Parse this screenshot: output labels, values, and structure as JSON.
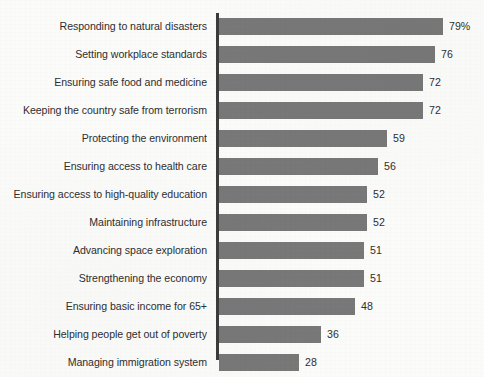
{
  "chart_data": {
    "type": "bar",
    "orientation": "horizontal",
    "title": "",
    "subtitle": "",
    "xlabel": "",
    "ylabel": "",
    "grid": false,
    "legend": false,
    "xlim": [
      0,
      79
    ],
    "value_unit": "%",
    "categories": [
      "Responding to natural disasters",
      "Setting workplace standards",
      "Ensuring safe food and medicine",
      "Keeping the country safe from terrorism",
      "Protecting the environment",
      "Ensuring access to health care",
      "Ensuring access to high-quality education",
      "Maintaining infrastructure",
      "Advancing space exploration",
      "Strengthening the economy",
      "Ensuring basic income for 65+",
      "Helping people get out of poverty",
      "Managing immigration system"
    ],
    "values": [
      79,
      76,
      72,
      72,
      59,
      56,
      52,
      52,
      51,
      51,
      48,
      36,
      28
    ],
    "value_labels": [
      "79%",
      "76",
      "72",
      "72",
      "59",
      "56",
      "52",
      "52",
      "51",
      "51",
      "48",
      "36",
      "28"
    ],
    "colors": {
      "bar": "#787878",
      "axis": "#3b3b3b",
      "text": "#2f2f2f",
      "background": "#fbfbfa"
    }
  }
}
